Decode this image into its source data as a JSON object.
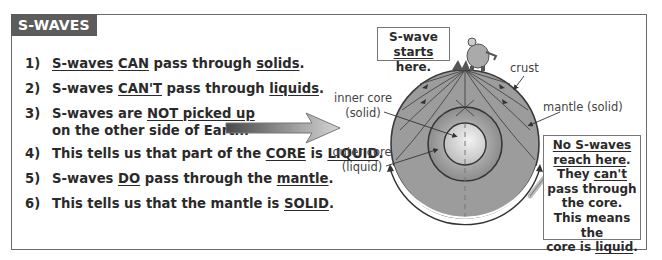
{
  "header": {
    "title": "S-WAVES"
  },
  "points": [
    {
      "num": "1)",
      "parts": [
        {
          "t": "S-waves",
          "u": true
        },
        {
          "t": " "
        },
        {
          "t": "CAN",
          "u": true
        },
        {
          "t": " pass through "
        },
        {
          "t": "solids",
          "u": true
        },
        {
          "t": "."
        }
      ]
    },
    {
      "num": "2)",
      "parts": [
        {
          "t": "S-waves "
        },
        {
          "t": "CAN'T",
          "u": true
        },
        {
          "t": " pass through "
        },
        {
          "t": "liquids",
          "u": true
        },
        {
          "t": "."
        }
      ]
    },
    {
      "num": "3)",
      "parts": [
        {
          "t": "S-waves are "
        },
        {
          "t": "NOT picked up",
          "u": true
        }
      ],
      "continuation": "on the other side of Earth."
    },
    {
      "num": "4)",
      "parts": [
        {
          "t": "This tells us that part of the "
        },
        {
          "t": "CORE",
          "u": true
        },
        {
          "t": " is "
        },
        {
          "t": "LIQUID",
          "u": true
        },
        {
          "t": "."
        }
      ]
    },
    {
      "num": "5)",
      "parts": [
        {
          "t": "S-waves "
        },
        {
          "t": "DO",
          "u": true
        },
        {
          "t": " pass through the "
        },
        {
          "t": "mantle",
          "u": true
        },
        {
          "t": "."
        }
      ]
    },
    {
      "num": "6)",
      "parts": [
        {
          "t": "This tells us that the mantle is "
        },
        {
          "t": "SOLID",
          "u": true
        },
        {
          "t": "."
        }
      ]
    }
  ],
  "diagram": {
    "start_callout": {
      "line1": "S-wave",
      "line2_u": "starts",
      "line2_rest": " here."
    },
    "labels": {
      "crust": "crust",
      "mantle": "mantle (solid)",
      "inner_core": "inner core",
      "inner_core_state": "(solid)",
      "outer_core": "outer core",
      "outer_core_state": "(liquid)"
    },
    "shadow_callout": {
      "line1": "No S-waves",
      "line2": "reach here",
      "line2_end": ".",
      "line3_a": "They ",
      "line3_u": "can't",
      "line4": "pass through",
      "line5": "the core.",
      "line6": "This means the",
      "line7_a": "core is ",
      "line7_u": "liquid",
      "line7_end": "."
    },
    "colors": {
      "mantle": "#9a9a9a",
      "outer_core": "#8e8e8e",
      "inner_core": "#d8d8d8",
      "outline": "#3a3a3a",
      "header_bg": "#5c5c5c"
    }
  }
}
